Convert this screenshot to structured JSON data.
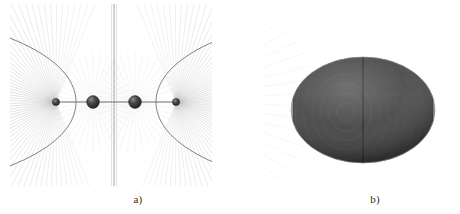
{
  "figure": {
    "background_color": "#ffffff",
    "panels": [
      {
        "id": "a",
        "caption": "a)",
        "kind": "field-line-diagram",
        "description": "Radiating field lines around four collinear charged spheres with hyperbolic separatrix curves and a vertical midplane line",
        "line_color": "#9a9a9a",
        "separatrix_color": "#555555",
        "sphere_color": "#3a3a3a",
        "axis_color": "#707070"
      },
      {
        "id": "b",
        "caption": "b)",
        "kind": "shaded-ellipsoid",
        "description": "Prolate ellipsoid rendered with light gray end caps, a dark gray central band and concentric interference ripples",
        "cap_color": "#b9b9b9",
        "band_color": "#3d3d3d",
        "ripple_color": "#6d6d6d",
        "seam_color": "#2a2a2a"
      }
    ]
  },
  "chart_data": {
    "type": "scatter",
    "title": "",
    "subtitle": "",
    "xlabel": "",
    "ylabel": "",
    "grid": false,
    "legend": null,
    "panel_a": {
      "type": "scatter",
      "title": "a)",
      "xlim": [
        0,
        202
      ],
      "ylim": [
        0,
        182
      ],
      "axis_line": {
        "y": 98,
        "x_start": 46,
        "x_end": 166
      },
      "midplane_line": {
        "x": 104,
        "y_start": 2,
        "y_end": 180
      },
      "spheres": [
        {
          "label": "s1",
          "cx": 46,
          "cy": 98,
          "r": 3.4,
          "kind": "small"
        },
        {
          "label": "s2",
          "cx": 83,
          "cy": 98,
          "r": 6.2,
          "kind": "large"
        },
        {
          "label": "s3",
          "cx": 125,
          "cy": 98,
          "r": 6.2,
          "kind": "large"
        },
        {
          "label": "s4",
          "cx": 166,
          "cy": 98,
          "r": 3.4,
          "kind": "small"
        }
      ],
      "ray_sources": [
        {
          "cx": 46,
          "cy": 98,
          "count": 64
        },
        {
          "cx": 166,
          "cy": 98,
          "count": 64
        }
      ],
      "separatrices": [
        {
          "side": "left",
          "vertex_x": 66,
          "cy": 98,
          "half_width": 42
        },
        {
          "side": "right",
          "vertex_x": 146,
          "cy": 98,
          "half_width": 42
        }
      ]
    },
    "panel_b": {
      "type": "scatter",
      "title": "b)",
      "xlim": [
        0,
        188
      ],
      "ylim": [
        0,
        182
      ],
      "ellipsoid": {
        "cx": 101,
        "cy": 106,
        "rx": 72,
        "ry": 53
      },
      "band": {
        "x_start": 31,
        "x_end": 171,
        "fill": "#3d3d3d"
      },
      "caps": [
        {
          "side": "left",
          "fill": "#b9b9b9"
        },
        {
          "side": "right",
          "fill": "#b9b9b9"
        }
      ],
      "seam": {
        "x": 101
      },
      "ripple_rings": 9,
      "ripple_center": {
        "cx": 84,
        "cy": 108
      }
    }
  }
}
